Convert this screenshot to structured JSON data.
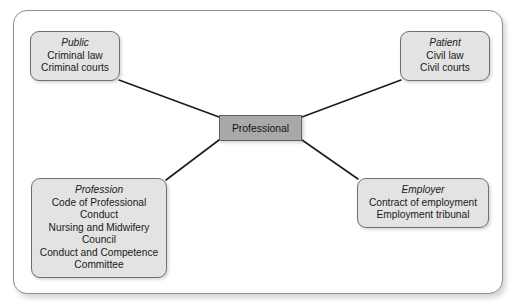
{
  "diagram": {
    "center": {
      "label": "Professional"
    },
    "nodes": [
      {
        "id": "public",
        "title": "Public",
        "lines": [
          "Criminal law",
          "Criminal courts"
        ]
      },
      {
        "id": "patient",
        "title": "Patient",
        "lines": [
          "Civil law",
          "Civil courts"
        ]
      },
      {
        "id": "profession",
        "title": "Profession",
        "lines": [
          "Code of Professional",
          "Conduct",
          "Nursing and Midwifery",
          "Council",
          "Conduct and Competence",
          "Committee"
        ]
      },
      {
        "id": "employer",
        "title": "Employer",
        "lines": [
          "Contract of employment",
          "Employment tribunal"
        ]
      }
    ],
    "colors": {
      "node_fill": "#e3e3e3",
      "node_border": "#6f6f6f",
      "center_fill": "#a9a9a9",
      "center_border": "#5f5f5f",
      "connector": "#1c1c1c",
      "frame_border": "#8e8e8e",
      "background": "#ffffff",
      "text": "#1a1a1a"
    }
  }
}
